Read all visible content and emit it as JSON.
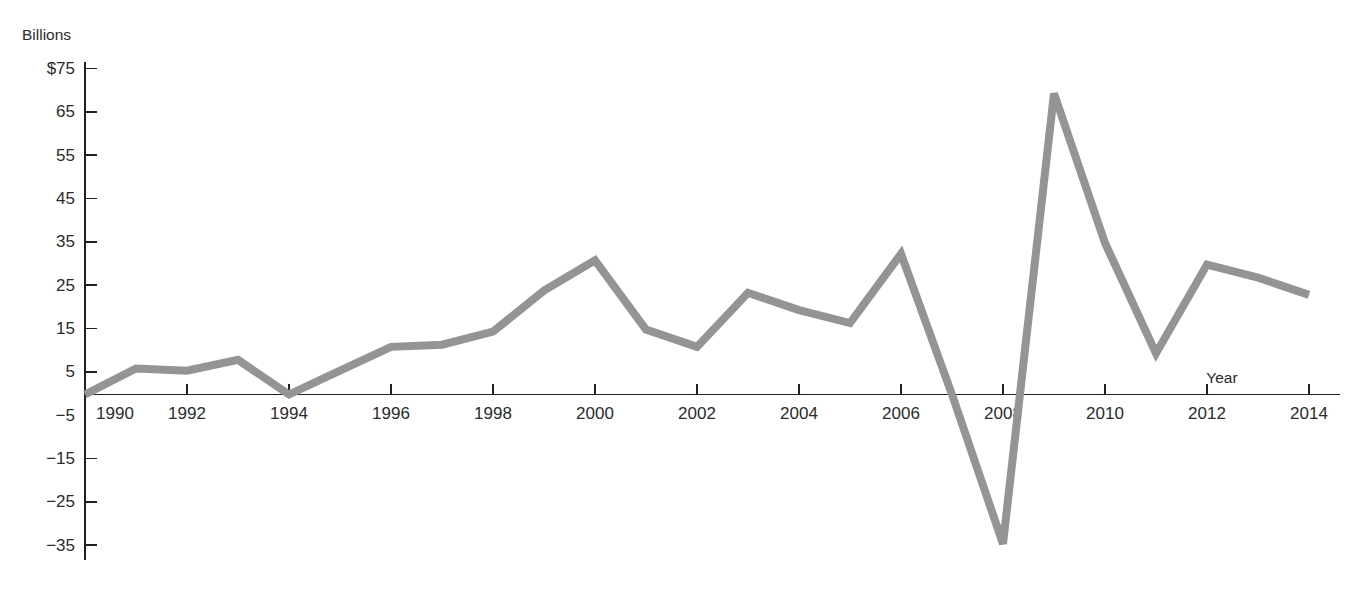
{
  "chart_data": {
    "type": "line",
    "title": "",
    "subtitle": "",
    "xlabel": "Year",
    "ylabel": "Billions",
    "y_unit_prefix": "$",
    "grid": false,
    "legend": null,
    "xlim": [
      1990,
      2014
    ],
    "ylim": [
      -35,
      75
    ],
    "y_ticks": [
      75,
      65,
      55,
      45,
      35,
      25,
      15,
      5,
      -5,
      -15,
      -25,
      -35
    ],
    "y_tick_labels": [
      "$75",
      "65",
      "55",
      "45",
      "35",
      "25",
      "15",
      "5",
      "−5",
      "−15",
      "−25",
      "−35"
    ],
    "x_ticks": [
      1990,
      1992,
      1994,
      1996,
      1998,
      2000,
      2002,
      2004,
      2006,
      2008,
      2010,
      2012,
      2014
    ],
    "x_tick_labels": [
      "1990",
      "1992",
      "1994",
      "1996",
      "1998",
      "2000",
      "2002",
      "2004",
      "2006",
      "2008",
      "2010",
      "2012",
      "2014"
    ],
    "x": [
      1990,
      1991,
      1992,
      1993,
      1994,
      1995,
      1996,
      1997,
      1998,
      1999,
      2000,
      2001,
      2002,
      2003,
      2004,
      2005,
      2006,
      2007,
      2008,
      2009,
      2010,
      2011,
      2012,
      2013,
      2014
    ],
    "values": [
      0,
      6,
      5.5,
      8,
      0,
      5.5,
      11,
      11.5,
      14.5,
      24,
      31,
      15,
      11,
      23.5,
      19.5,
      16.5,
      32.5,
      0,
      -34.5,
      69.5,
      35,
      9.5,
      30,
      27,
      23
    ],
    "series": [
      {
        "name": "Billions",
        "color": "#949494",
        "values": [
          0,
          6,
          5.5,
          8,
          0,
          5.5,
          11,
          11.5,
          14.5,
          24,
          31,
          15,
          11,
          23.5,
          19.5,
          16.5,
          32.5,
          0,
          -34.5,
          69.5,
          35,
          9.5,
          30,
          27,
          23
        ]
      }
    ]
  },
  "colors": {
    "line": "#949494",
    "axis": "#231f20",
    "text": "#2b2b2b",
    "background": "#ffffff"
  }
}
